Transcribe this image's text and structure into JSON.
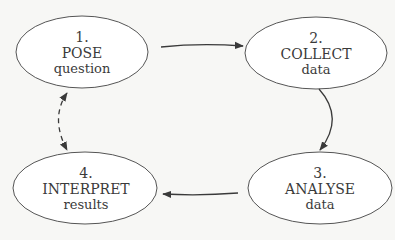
{
  "diagram": {
    "type": "cycle",
    "colors": {
      "background": "#f7f7f5",
      "stroke": "#3a3a3a",
      "fill": "#ffffff"
    },
    "nodes": [
      {
        "id": "pose",
        "number": "1.",
        "title": "POSE",
        "subtitle": "question"
      },
      {
        "id": "collect",
        "number": "2.",
        "title": "COLLECT",
        "subtitle": "data"
      },
      {
        "id": "analyse",
        "number": "3.",
        "title": "ANALYSE",
        "subtitle": "data"
      },
      {
        "id": "interpret",
        "number": "4.",
        "title": "INTERPRET",
        "subtitle": "results"
      }
    ],
    "edges": [
      {
        "from": "pose",
        "to": "collect",
        "style": "solid",
        "direction": "forward"
      },
      {
        "from": "collect",
        "to": "analyse",
        "style": "solid",
        "direction": "forward"
      },
      {
        "from": "analyse",
        "to": "interpret",
        "style": "solid",
        "direction": "forward"
      },
      {
        "from": "interpret",
        "to": "pose",
        "style": "dashed",
        "direction": "bidirectional"
      }
    ]
  }
}
